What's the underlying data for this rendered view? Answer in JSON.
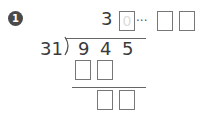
{
  "problem": {
    "number": "1",
    "quotient_digit": "3",
    "quotient_hint": "0",
    "remainder_separator": "···",
    "divisor": "31",
    "dividend_digits": [
      "9",
      "4",
      "5"
    ]
  }
}
